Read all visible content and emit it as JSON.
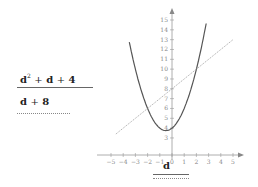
{
  "expressions": {
    "first": {
      "base": "d",
      "exp": "2",
      "rest_1": "+",
      "term_2": "d",
      "rest_2": "+",
      "const": "4",
      "full": "d² + d + 4",
      "underline": "solid"
    },
    "second": {
      "term": "d",
      "op": "+",
      "const": "8",
      "full": "d + 8",
      "underline": "dotted"
    }
  },
  "answer": {
    "label": "d",
    "lines": [
      "solid",
      "dotted"
    ]
  },
  "chart_data": {
    "type": "line",
    "title": "",
    "xlabel": "",
    "ylabel": "",
    "x_ticks": [
      "-5",
      "-4",
      "-3",
      "-2",
      "-1",
      "0",
      "1",
      "2",
      "3",
      "4",
      "5"
    ],
    "y_ticks": [
      "3",
      "4",
      "5",
      "6",
      "7",
      "8",
      "9",
      "10",
      "11",
      "12",
      "13",
      "14",
      "15"
    ],
    "xlim": [
      -5.5,
      5.5
    ],
    "ylim": [
      1.5,
      16
    ],
    "grid": false,
    "series": [
      {
        "name": "d^2 + d + 4",
        "style": "solid",
        "color": "#555555",
        "points": [
          [
            -3.5,
            12.75
          ],
          [
            -3,
            10
          ],
          [
            -2,
            6
          ],
          [
            -1,
            4
          ],
          [
            -0.5,
            3.75
          ],
          [
            0,
            4
          ],
          [
            1,
            6
          ],
          [
            2,
            10
          ],
          [
            2.8,
            14.64
          ]
        ]
      },
      {
        "name": "d + 8",
        "style": "dotted",
        "color": "#999999",
        "points": [
          [
            -4.6,
            3.4
          ],
          [
            5,
            13
          ]
        ]
      }
    ],
    "intersections": [
      [
        -2,
        6
      ],
      [
        2,
        10
      ]
    ]
  }
}
